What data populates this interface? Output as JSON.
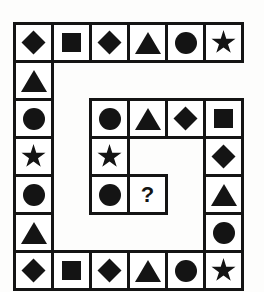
{
  "puzzle": {
    "title": "Shape Sequence Spiral Puzzle",
    "type": "visual-reasoning-grid",
    "columns": 6,
    "rows": 7,
    "cell_size": 38,
    "colors": {
      "shape_fill": "#141414",
      "cell_border": "#141414",
      "cell_background": "#ffffff",
      "page_background": "#fdfdfc"
    },
    "missing_marker": "?",
    "shape_names": [
      "diamond",
      "square",
      "triangle",
      "circle",
      "star"
    ],
    "grid": [
      [
        {
          "row": 1,
          "col": 1,
          "shape": "diamond",
          "present": true
        },
        {
          "row": 1,
          "col": 2,
          "shape": "square",
          "present": true
        },
        {
          "row": 1,
          "col": 3,
          "shape": "diamond",
          "present": true
        },
        {
          "row": 1,
          "col": 4,
          "shape": "triangle",
          "present": true
        },
        {
          "row": 1,
          "col": 5,
          "shape": "circle",
          "present": true
        },
        {
          "row": 1,
          "col": 6,
          "shape": "star",
          "present": true
        }
      ],
      [
        {
          "row": 2,
          "col": 1,
          "shape": "triangle",
          "present": true
        },
        {
          "row": 2,
          "col": 2,
          "shape": null,
          "present": false
        },
        {
          "row": 2,
          "col": 3,
          "shape": null,
          "present": false
        },
        {
          "row": 2,
          "col": 4,
          "shape": null,
          "present": false
        },
        {
          "row": 2,
          "col": 5,
          "shape": null,
          "present": false
        },
        {
          "row": 2,
          "col": 6,
          "shape": null,
          "present": false
        }
      ],
      [
        {
          "row": 3,
          "col": 1,
          "shape": "circle",
          "present": true
        },
        {
          "row": 3,
          "col": 2,
          "shape": null,
          "present": false
        },
        {
          "row": 3,
          "col": 3,
          "shape": "circle",
          "present": true
        },
        {
          "row": 3,
          "col": 4,
          "shape": "triangle",
          "present": true
        },
        {
          "row": 3,
          "col": 5,
          "shape": "diamond",
          "present": true
        },
        {
          "row": 3,
          "col": 6,
          "shape": "square",
          "present": true
        }
      ],
      [
        {
          "row": 4,
          "col": 1,
          "shape": "star",
          "present": true
        },
        {
          "row": 4,
          "col": 2,
          "shape": null,
          "present": false
        },
        {
          "row": 4,
          "col": 3,
          "shape": "star",
          "present": true
        },
        {
          "row": 4,
          "col": 4,
          "shape": null,
          "present": false
        },
        {
          "row": 4,
          "col": 5,
          "shape": null,
          "present": false
        },
        {
          "row": 4,
          "col": 6,
          "shape": "diamond",
          "present": true
        }
      ],
      [
        {
          "row": 5,
          "col": 1,
          "shape": "circle",
          "present": true
        },
        {
          "row": 5,
          "col": 2,
          "shape": null,
          "present": false
        },
        {
          "row": 5,
          "col": 3,
          "shape": "circle",
          "present": true
        },
        {
          "row": 5,
          "col": 4,
          "shape": "question",
          "present": true
        },
        {
          "row": 5,
          "col": 5,
          "shape": null,
          "present": false
        },
        {
          "row": 5,
          "col": 6,
          "shape": "triangle",
          "present": true
        }
      ],
      [
        {
          "row": 6,
          "col": 1,
          "shape": "triangle",
          "present": true
        },
        {
          "row": 6,
          "col": 2,
          "shape": null,
          "present": false
        },
        {
          "row": 6,
          "col": 3,
          "shape": null,
          "present": false
        },
        {
          "row": 6,
          "col": 4,
          "shape": null,
          "present": false
        },
        {
          "row": 6,
          "col": 5,
          "shape": null,
          "present": false
        },
        {
          "row": 6,
          "col": 6,
          "shape": "circle",
          "present": true
        }
      ],
      [
        {
          "row": 7,
          "col": 1,
          "shape": "diamond",
          "present": true
        },
        {
          "row": 7,
          "col": 2,
          "shape": "square",
          "present": true
        },
        {
          "row": 7,
          "col": 3,
          "shape": "diamond",
          "present": true
        },
        {
          "row": 7,
          "col": 4,
          "shape": "triangle",
          "present": true
        },
        {
          "row": 7,
          "col": 5,
          "shape": "circle",
          "present": true
        },
        {
          "row": 7,
          "col": 6,
          "shape": "star",
          "present": true
        }
      ]
    ]
  }
}
